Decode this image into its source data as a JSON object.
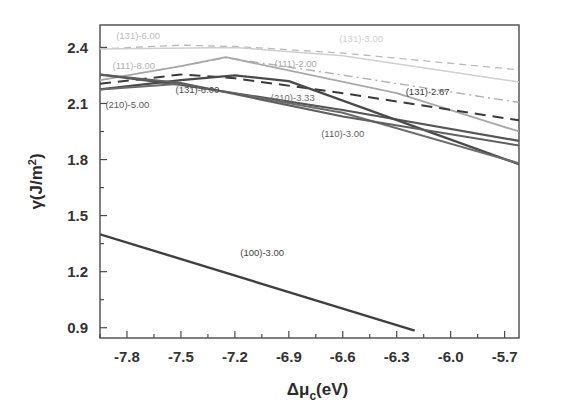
{
  "chart_data": {
    "type": "line",
    "title": "",
    "xlabel": "Δμ_c(eV)",
    "xlabel_parts": {
      "delta_mu": "Δμ",
      "sub": "c",
      "unit": "(eV)"
    },
    "ylabel": "γ(J/m²)",
    "ylabel_parts": {
      "gamma": "γ(J/m",
      "sup": "2",
      "close": ")"
    },
    "xlim": [
      -7.95,
      -5.62
    ],
    "ylim": [
      0.845,
      2.52
    ],
    "xticks": [
      -7.8,
      -7.5,
      -7.2,
      -6.9,
      -6.6,
      -6.3,
      -6.0,
      -5.7
    ],
    "xtick_labels": [
      "-7.8",
      "-7.5",
      "-7.2",
      "-6.9",
      "-6.6",
      "-6.3",
      "-6.0",
      "-5.7"
    ],
    "yticks": [
      0.9,
      1.2,
      1.5,
      1.8,
      2.1,
      2.4
    ],
    "ytick_labels": [
      "0.9",
      "1.2",
      "1.5",
      "1.8",
      "2.1",
      "2.4"
    ],
    "x_minor_step": 0.15,
    "y_minor_step": 0.15,
    "grid": false,
    "legend": "inline-annotations",
    "series": [
      {
        "name": "(131)-6.00",
        "label": "(131)-6.00",
        "style": "dashed",
        "color": "#b9b9b9",
        "width": 1.3,
        "dash": "7,5",
        "label_x": -7.86,
        "label_y": 2.445,
        "points": [
          {
            "x": -7.95,
            "y": 2.392
          },
          {
            "x": -7.5,
            "y": 2.412
          },
          {
            "x": -7.2,
            "y": 2.405
          },
          {
            "x": -6.6,
            "y": 2.37
          },
          {
            "x": -5.62,
            "y": 2.28
          }
        ]
      },
      {
        "name": "(131)-3.00",
        "label": "(131)-3.00",
        "style": "solid",
        "color": "#cfcfcf",
        "width": 1.5,
        "dash": "none",
        "label_x": -6.62,
        "label_y": 2.43,
        "points": [
          {
            "x": -7.95,
            "y": 2.392
          },
          {
            "x": -7.2,
            "y": 2.4
          },
          {
            "x": -6.6,
            "y": 2.355
          },
          {
            "x": -5.62,
            "y": 2.215
          }
        ]
      },
      {
        "name": "(111)-8.00",
        "label": "(111)-8.00",
        "style": "dashdot",
        "color": "#b0b0b0",
        "width": 1.4,
        "dash": "9,4,2,4",
        "label_x": -7.88,
        "label_y": 2.285,
        "points": [
          {
            "x": -7.95,
            "y": 2.225
          },
          {
            "x": -7.5,
            "y": 2.3
          },
          {
            "x": -7.25,
            "y": 2.345
          },
          {
            "x": -6.6,
            "y": 2.252
          },
          {
            "x": -5.62,
            "y": 2.105
          }
        ]
      },
      {
        "name": "(111)-2.00",
        "label": "(111)-2.00",
        "style": "solid",
        "color": "#a8a8a8",
        "width": 1.8,
        "dash": "none",
        "label_x": -6.98,
        "label_y": 2.295,
        "points": [
          {
            "x": -7.95,
            "y": 2.225
          },
          {
            "x": -7.5,
            "y": 2.3
          },
          {
            "x": -7.25,
            "y": 2.348
          },
          {
            "x": -6.3,
            "y": 2.155
          },
          {
            "x": -5.62,
            "y": 1.95
          }
        ]
      },
      {
        "name": "(131)-2.67",
        "label": "(131)-2.67",
        "style": "dashed",
        "color": "#3a3a3a",
        "width": 2.0,
        "dash": "11,7",
        "label_x": -6.25,
        "label_y": 2.145,
        "points": [
          {
            "x": -7.95,
            "y": 2.205
          },
          {
            "x": -7.5,
            "y": 2.255
          },
          {
            "x": -7.2,
            "y": 2.235
          },
          {
            "x": -6.6,
            "y": 2.155
          },
          {
            "x": -5.62,
            "y": 2.01
          }
        ]
      },
      {
        "name": "(210)-5.00",
        "label": "(210)-5.00",
        "style": "solid",
        "color": "#555555",
        "width": 2.2,
        "dash": "none",
        "label_x": -7.92,
        "label_y": 2.075,
        "points": [
          {
            "x": -7.95,
            "y": 2.255
          },
          {
            "x": -7.5,
            "y": 2.2
          },
          {
            "x": -6.6,
            "y": 2.065
          },
          {
            "x": -5.62,
            "y": 1.9
          }
        ]
      },
      {
        "name": "(131)-6.00-solid",
        "label": "(131)-6.00",
        "style": "solid",
        "color": "#4a4a4a",
        "width": 2.3,
        "dash": "none",
        "label_x": -7.53,
        "label_y": 2.155,
        "points": [
          {
            "x": -7.95,
            "y": 2.175
          },
          {
            "x": -7.5,
            "y": 2.225
          },
          {
            "x": -7.2,
            "y": 2.25
          },
          {
            "x": -6.9,
            "y": 2.22
          },
          {
            "x": -5.62,
            "y": 1.775
          }
        ]
      },
      {
        "name": "(210)-3.33",
        "label": "(210)-3.33",
        "style": "solid",
        "color": "#6b6b6b",
        "width": 2.0,
        "dash": "none",
        "label_x": -7.0,
        "label_y": 2.115,
        "points": [
          {
            "x": -7.95,
            "y": 2.175
          },
          {
            "x": -7.5,
            "y": 2.205
          },
          {
            "x": -6.6,
            "y": 2.05
          },
          {
            "x": -5.62,
            "y": 1.78
          }
        ]
      },
      {
        "name": "(110)-3.00",
        "label": "(110)-3.00",
        "style": "solid",
        "color": "#5f5f5f",
        "width": 2.1,
        "dash": "none",
        "label_x": -6.72,
        "label_y": 1.92,
        "points": [
          {
            "x": -7.95,
            "y": 2.255
          },
          {
            "x": -7.5,
            "y": 2.21
          },
          {
            "x": -6.6,
            "y": 2.03
          },
          {
            "x": -5.62,
            "y": 1.875
          }
        ]
      },
      {
        "name": "(100)-3.00",
        "label": "(100)-3.00",
        "style": "solid",
        "color": "#3f3f3f",
        "width": 2.4,
        "dash": "none",
        "label_x": -7.17,
        "label_y": 1.285,
        "points": [
          {
            "x": -7.95,
            "y": 1.4
          },
          {
            "x": -6.2,
            "y": 0.885
          }
        ]
      }
    ]
  }
}
